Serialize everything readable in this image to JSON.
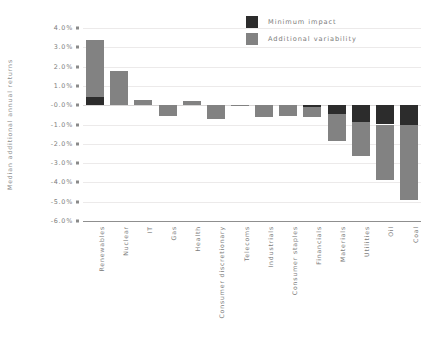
{
  "chart_data": {
    "type": "bar",
    "title": "",
    "subtitle": "",
    "xlabel": "",
    "ylabel": "Median additional annual returns",
    "ylim": [
      -6.0,
      4.0
    ],
    "yticks": [
      "4.0%",
      "3.0%",
      "2.0%",
      "1.0%",
      "-0.0%",
      "-1.0%",
      "-2.0%",
      "-3.0%",
      "-4.0%",
      "-5.0%",
      "-6.0%"
    ],
    "ytick_values": [
      4.0,
      3.0,
      2.0,
      1.0,
      0.0,
      -1.0,
      -2.0,
      -3.0,
      -4.0,
      -5.0,
      -6.0
    ],
    "grid": true,
    "stacked": true,
    "legend_position": "top-right",
    "categories": [
      "Renewables",
      "Nuclear",
      "IT",
      "Gas",
      "Health",
      "Consumer discretionary",
      "Telecoms",
      "Industrials",
      "Consumer staples",
      "Financials",
      "Materials",
      "Utilities",
      "Oil",
      "Coal"
    ],
    "series": [
      {
        "name": "Minimum impact",
        "color": "#2c2c2c",
        "values": [
          0.45,
          0.0,
          0.0,
          0.0,
          0.0,
          0.0,
          0.0,
          0.0,
          0.0,
          -0.1,
          -0.45,
          -0.85,
          -1.0,
          -1.05
        ]
      },
      {
        "name": "Additional variability",
        "color": "#828282",
        "values": [
          2.95,
          1.75,
          0.25,
          -0.55,
          0.2,
          -0.7,
          -0.05,
          -0.6,
          -0.55,
          -0.5,
          -1.4,
          -1.8,
          -2.85,
          -3.85
        ]
      }
    ],
    "totals": [
      3.4,
      1.75,
      0.25,
      -0.55,
      0.2,
      -0.7,
      -0.05,
      -0.6,
      -0.55,
      -0.6,
      -1.85,
      -2.65,
      -3.85,
      -4.9
    ]
  },
  "legend": {
    "items": [
      {
        "label": "Minimum impact",
        "color": "#2c2c2c"
      },
      {
        "label": "Additional variability",
        "color": "#828282"
      }
    ]
  },
  "axis": {
    "y_title": "Median additional annual returns"
  }
}
